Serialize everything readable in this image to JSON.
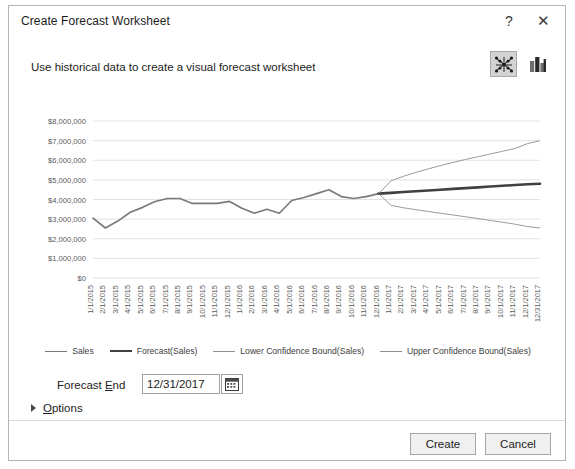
{
  "dialog": {
    "title": "Create Forecast Worksheet",
    "help_icon": "question-mark-icon",
    "close_icon": "close-icon",
    "instruction": "Use historical data to create a visual forecast worksheet"
  },
  "chart_type_toggle": {
    "line_label": "line-chart-icon",
    "column_label": "column-chart-icon",
    "selected": "line"
  },
  "legend": {
    "items": [
      {
        "label": "Sales",
        "color": "#7a7a7a",
        "width": "1.7px"
      },
      {
        "label": "Forecast(Sales)",
        "color": "#404040",
        "width": "2.6px"
      },
      {
        "label": "Lower Confidence Bound(Sales)",
        "color": "#8f8f8f",
        "width": "0.9px"
      },
      {
        "label": "Upper Confidence Bound(Sales)",
        "color": "#8f8f8f",
        "width": "0.9px"
      }
    ]
  },
  "controls": {
    "forecast_end_label_pre": "Forecast ",
    "forecast_end_label_accel": "E",
    "forecast_end_label_post": "nd",
    "forecast_end_value": "12/31/2017",
    "forecast_end_placeholder": "mm/dd/yyyy",
    "calendar_icon": "calendar-icon",
    "options_label_accel": "O",
    "options_label_post": "ptions",
    "options_expanded": false
  },
  "footer": {
    "create_label": "Create",
    "cancel_label": "Cancel"
  },
  "chart_data": {
    "type": "line",
    "title": "",
    "xlabel": "",
    "ylabel": "",
    "ylim": [
      0,
      8000000
    ],
    "ytick_labels": [
      "$8,000,000",
      "$7,000,000",
      "$6,000,000",
      "$5,000,000",
      "$4,000,000",
      "$3,000,000",
      "$2,000,000",
      "$1,000,000",
      "$0"
    ],
    "ytick_values": [
      8000000,
      7000000,
      6000000,
      5000000,
      4000000,
      3000000,
      2000000,
      1000000,
      0
    ],
    "grid": true,
    "legend_position": "bottom",
    "categories": [
      "1/1/2015",
      "2/1/2015",
      "3/1/2015",
      "4/1/2015",
      "5/1/2015",
      "6/1/2015",
      "7/1/2015",
      "8/1/2015",
      "9/1/2015",
      "10/1/2015",
      "11/1/2015",
      "12/1/2015",
      "1/1/2016",
      "2/1/2016",
      "3/1/2016",
      "4/1/2016",
      "5/1/2016",
      "6/1/2016",
      "7/1/2016",
      "8/1/2016",
      "9/1/2016",
      "10/1/2016",
      "11/1/2016",
      "12/1/2016",
      "1/1/2017",
      "2/1/2017",
      "3/1/2017",
      "4/1/2017",
      "5/1/2017",
      "6/1/2017",
      "7/1/2017",
      "8/1/2017",
      "9/1/2017",
      "10/1/2017",
      "11/1/2017",
      "12/1/2017",
      "12/31/2017"
    ],
    "series": [
      {
        "name": "Sales",
        "values": [
          3050000,
          2550000,
          2900000,
          3350000,
          3600000,
          3900000,
          4050000,
          4050000,
          3800000,
          3800000,
          3800000,
          3900000,
          3550000,
          3300000,
          3500000,
          3300000,
          3950000,
          4100000,
          4300000,
          4500000,
          4150000,
          4050000,
          4150000,
          4300000,
          null,
          null,
          null,
          null,
          null,
          null,
          null,
          null,
          null,
          null,
          null,
          null,
          null
        ]
      },
      {
        "name": "Forecast(Sales)",
        "values": [
          null,
          null,
          null,
          null,
          null,
          null,
          null,
          null,
          null,
          null,
          null,
          null,
          null,
          null,
          null,
          null,
          null,
          null,
          null,
          null,
          null,
          null,
          null,
          4300000,
          4340000,
          4380000,
          4420000,
          4460000,
          4500000,
          4540000,
          4580000,
          4620000,
          4660000,
          4700000,
          4740000,
          4780000,
          4800000
        ]
      },
      {
        "name": "Lower Confidence Bound(Sales)",
        "values": [
          null,
          null,
          null,
          null,
          null,
          null,
          null,
          null,
          null,
          null,
          null,
          null,
          null,
          null,
          null,
          null,
          null,
          null,
          null,
          null,
          null,
          null,
          null,
          4300000,
          3700000,
          3580000,
          3480000,
          3390000,
          3300000,
          3210000,
          3120000,
          3030000,
          2930000,
          2840000,
          2740000,
          2620000,
          2550000
        ]
      },
      {
        "name": "Upper Confidence Bound(Sales)",
        "values": [
          null,
          null,
          null,
          null,
          null,
          null,
          null,
          null,
          null,
          null,
          null,
          null,
          null,
          null,
          null,
          null,
          null,
          null,
          null,
          null,
          null,
          null,
          null,
          4300000,
          4950000,
          5180000,
          5380000,
          5560000,
          5730000,
          5890000,
          6040000,
          6180000,
          6320000,
          6460000,
          6600000,
          6850000,
          7000000
        ]
      }
    ]
  }
}
